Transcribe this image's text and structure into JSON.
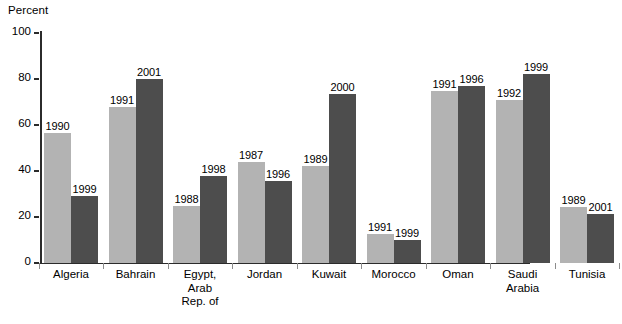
{
  "chart_data": {
    "type": "bar",
    "title": "",
    "subtitle": "",
    "xlabel": "",
    "ylabel": "Percent",
    "ylim": [
      0,
      100
    ],
    "yticks": [
      0,
      20,
      40,
      60,
      80,
      100
    ],
    "grid": false,
    "legend": "none",
    "categories": [
      "Algeria",
      "Bahrain",
      "Egypt,\nArab\nRep. of",
      "Jordan",
      "Kuwait",
      "Morocco",
      "Oman",
      "Saudi\nArabia",
      "Tunisia"
    ],
    "series": [
      {
        "name": "Earlier year",
        "color": "#b3b3b3",
        "values": [
          56.5,
          68,
          25,
          44,
          42,
          12.5,
          75,
          71,
          24.5
        ],
        "point_labels": [
          "1990",
          "1991",
          "1988",
          "1987",
          "1989",
          "1991",
          "1991",
          "1992",
          "1989"
        ]
      },
      {
        "name": "Later year",
        "color": "#4d4d4d",
        "values": [
          29,
          80,
          38,
          35.5,
          73.5,
          10,
          77,
          82,
          21.5
        ],
        "point_labels": [
          "1999",
          "2001",
          "1998",
          "1996",
          "2000",
          "1999",
          "1996",
          "1999",
          "2001"
        ]
      }
    ]
  },
  "colors": {
    "light_bar": "#b3b3b3",
    "dark_bar": "#4d4d4d",
    "axis": "#2b2b2b",
    "background": "#ffffff"
  }
}
